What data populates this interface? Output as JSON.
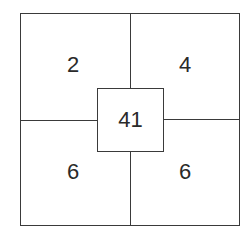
{
  "diagram": {
    "quadrants": {
      "top_left": "2",
      "top_right": "4",
      "bottom_left": "6",
      "bottom_right": "6"
    },
    "center": "41",
    "line_color": "#3a3a3a"
  }
}
